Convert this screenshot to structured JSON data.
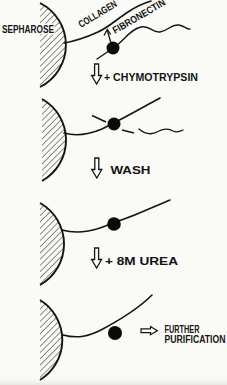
{
  "figure": {
    "kind": "purification-scheme-diagram",
    "labels": {
      "sepharose": "SEPHAROSE",
      "collagen": "COLLAGEN",
      "fibronectin": "FIBRONECTIN"
    },
    "steps": [
      {
        "arrow_icon": "down-block-arrow",
        "label": "+ CHYMOTRYPSIN"
      },
      {
        "arrow_icon": "down-block-arrow",
        "label": "WASH"
      },
      {
        "arrow_icon": "down-block-arrow",
        "label": "+ 8M UREA"
      },
      {
        "arrow_icon": "right-block-arrow",
        "label_lines": [
          "FURTHER",
          "PURIFICATION"
        ]
      }
    ],
    "colors": {
      "ink": "#141414",
      "paper": "#fafaf7",
      "dot": "#0a0a0a",
      "arrow_fill": "#fefefe"
    }
  }
}
